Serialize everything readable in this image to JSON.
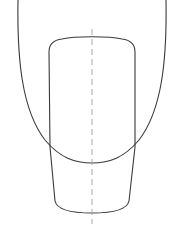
{
  "diagram": {
    "colors": {
      "stroke": "#3a3a3a",
      "centerline": "#aaaaaa",
      "background": "#ffffff"
    },
    "shapes": [
      {
        "name": "outer-oval",
        "type": "oval"
      },
      {
        "name": "inner-nail-shape",
        "type": "rounded-tapered-rectangle"
      },
      {
        "name": "center-axis",
        "type": "dashed-line"
      }
    ]
  }
}
